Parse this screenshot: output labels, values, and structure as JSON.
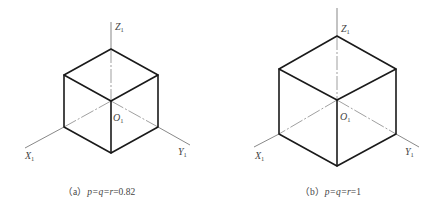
{
  "figures": [
    {
      "id": "a",
      "caption": {
        "prefix": "（a）",
        "formula": "p=q=r",
        "value": "=0.82"
      },
      "axes": {
        "z": "Z",
        "x": "X",
        "y": "Y",
        "origin": "O",
        "subscript": "1"
      }
    },
    {
      "id": "b",
      "caption": {
        "prefix": "（b）",
        "formula": "p=q=r",
        "value": "=1"
      },
      "axes": {
        "z": "Z",
        "x": "X",
        "y": "Y",
        "origin": "O",
        "subscript": "1"
      }
    }
  ],
  "colors": {
    "edge": "#1a1a1a",
    "axis": "#555555",
    "text": "#444444",
    "background": "#ffffff"
  }
}
